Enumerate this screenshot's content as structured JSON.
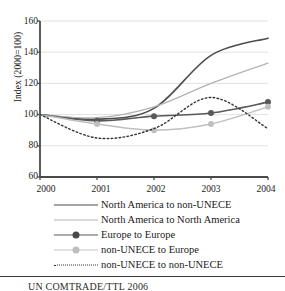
{
  "chart_data": {
    "type": "line",
    "title": "",
    "xlabel": "",
    "ylabel": "Index (2000=100)",
    "x": [
      2000,
      2001,
      2002,
      2003,
      2004
    ],
    "xticklabels": [
      "2000",
      "2001",
      "2002",
      "2003",
      "2004"
    ],
    "yticklabels": [
      "60",
      "80",
      "100",
      "120",
      "140",
      "160"
    ],
    "yticks": [
      60,
      80,
      100,
      120,
      140,
      160
    ],
    "ylim": [
      60,
      160
    ],
    "xlim": [
      2000,
      2004
    ],
    "grid": "horizontal",
    "legend_position": "below",
    "series": [
      {
        "name": "North America to non-UNECE",
        "values": [
          100,
          97,
          104,
          138,
          149
        ],
        "color": "#4d4d4d",
        "line_style": "solid",
        "line_width": 1.6,
        "marker": "none"
      },
      {
        "name": "North America to North America",
        "values": [
          100,
          98,
          105,
          120,
          133
        ],
        "color": "#b3b3b3",
        "line_style": "solid",
        "line_width": 1.3,
        "marker": "none"
      },
      {
        "name": "Europe to Europe",
        "values": [
          100,
          96,
          99,
          101,
          108
        ],
        "color": "#595959",
        "line_style": "solid",
        "line_width": 1.6,
        "marker": "circle"
      },
      {
        "name": "non-UNECE to Europe",
        "values": [
          100,
          94,
          90,
          94,
          105
        ],
        "color": "#bfbfbf",
        "line_style": "solid",
        "line_width": 1.4,
        "marker": "circle"
      },
      {
        "name": "non-UNECE to non-UNECE",
        "values": [
          100,
          85,
          91,
          111,
          91
        ],
        "color": "#333333",
        "line_style": "dotted",
        "line_width": 1.4,
        "marker": "none"
      }
    ]
  },
  "axis": {
    "y_label": "Index (2000=100)",
    "y_ticks": [
      "160",
      "140",
      "120",
      "100",
      "80",
      "60"
    ],
    "x_ticks": [
      "2000",
      "2001",
      "2002",
      "2003",
      "2004"
    ]
  },
  "legend": {
    "items": [
      {
        "label": "North America to non-UNECE"
      },
      {
        "label": "North America to North America"
      },
      {
        "label": "Europe to Europe"
      },
      {
        "label": "non-UNECE to Europe"
      },
      {
        "label": "non-UNECE to non-UNECE"
      }
    ]
  },
  "footer": {
    "source": "UN COMTRADE/TTL 2006"
  }
}
